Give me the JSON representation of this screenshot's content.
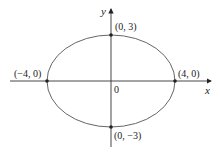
{
  "diagram": {
    "type": "ellipse",
    "equation_params": {
      "a": 4,
      "b": 3
    },
    "axes": {
      "x_label": "x",
      "y_label": "y",
      "origin_label": "0"
    },
    "points": [
      {
        "id": "right-vertex",
        "label": "(4, 0)"
      },
      {
        "id": "left-vertex",
        "label": "(−4, 0)"
      },
      {
        "id": "top-vertex",
        "label": "(0, 3)"
      },
      {
        "id": "bottom-vertex",
        "label": "(0, −3)"
      }
    ],
    "colors": {
      "curve": "#555555",
      "axes": "#333333",
      "points": "#222222"
    }
  }
}
